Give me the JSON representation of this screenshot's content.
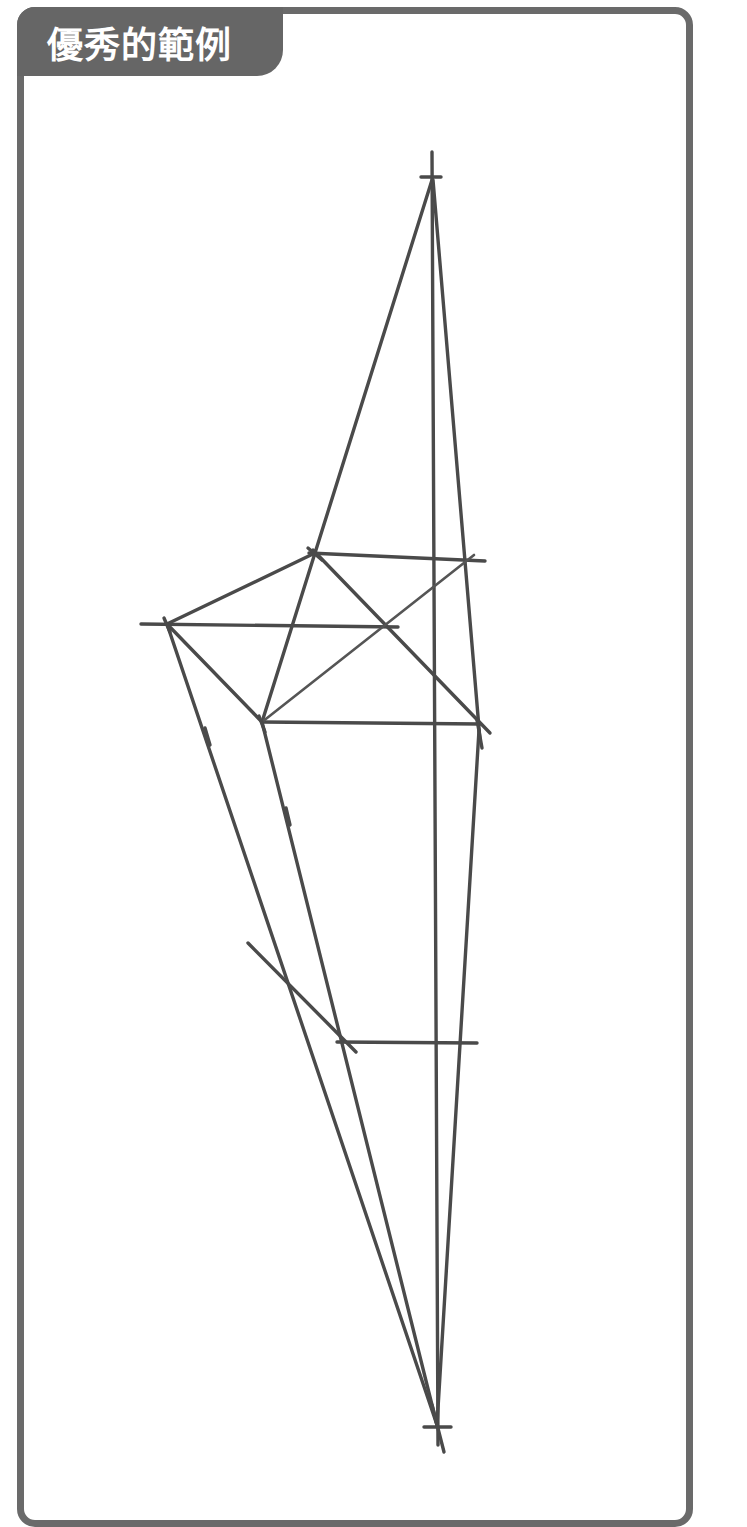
{
  "panel": {
    "label": "優秀的範例",
    "label_bg_color": "#666666",
    "label_text_color": "#ffffff",
    "border_color": "#6a6a6a"
  },
  "drawing": {
    "stroke_color": "#4a4a4a",
    "points": {
      "apex_top": [
        432,
        177
      ],
      "apex_bottom": [
        437,
        1427
      ],
      "p1": [
        315,
        553
      ],
      "p2": [
        167,
        624
      ],
      "p3": [
        262,
        722
      ],
      "p4": [
        479,
        726
      ],
      "cross": [
        384,
        626
      ],
      "p5": [
        343,
        1042
      ]
    }
  }
}
